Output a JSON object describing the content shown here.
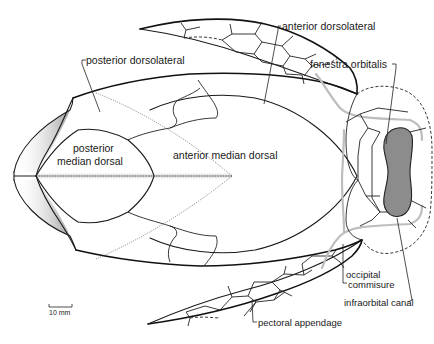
{
  "figure": {
    "labels": {
      "posterior_dorsolateral": "posterior dorsolateral",
      "anterior_dorsolateral": "anterior dorsolateral",
      "fenestra_orbitalis": "fenestra orbitalis",
      "posterior_median_dorsal_1": "posterior",
      "posterior_median_dorsal_2": "median dorsal",
      "anterior_median_dorsal": "anterior  median  dorsal",
      "occipital_commisure_1": "occipital",
      "occipital_commisure_2": "commisure",
      "infraorbital_canal": "infraorbital canal",
      "pectoral_appendage": "pectoral appendage"
    },
    "scale_bar": {
      "label": "10 mm"
    },
    "colors": {
      "line": "#1a1a1a",
      "sensory_canal": "#bdbdbd",
      "orbit_fill": "#8c8c8c",
      "background": "#ffffff"
    }
  }
}
